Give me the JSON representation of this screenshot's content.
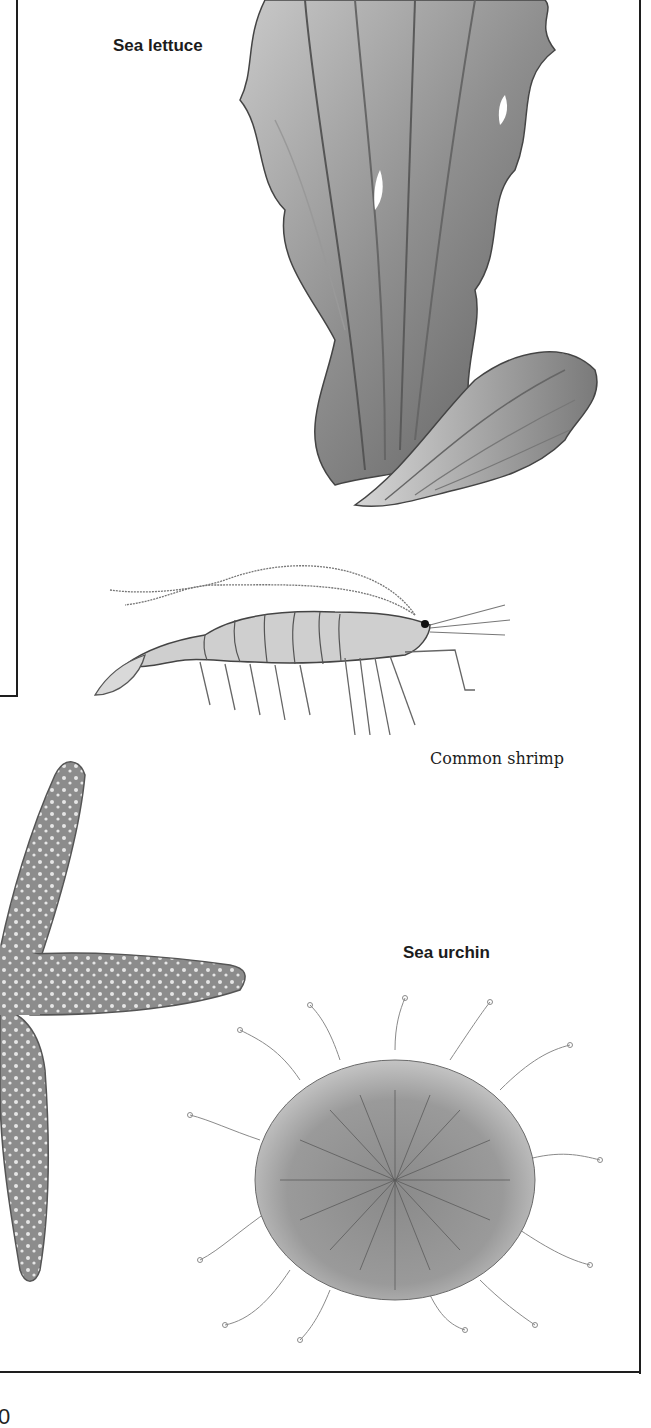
{
  "figure": {
    "labels": {
      "sea_lettuce": "Sea lettuce",
      "common_shrimp": "Common shrimp",
      "sea_urchin": "Sea urchin"
    },
    "illustrations": [
      {
        "name": "sea-lettuce-illustration",
        "subject": "Sea lettuce"
      },
      {
        "name": "common-shrimp-illustration",
        "subject": "Common shrimp"
      },
      {
        "name": "starfish-illustration",
        "subject": "Starfish (partial, cropped)"
      },
      {
        "name": "sea-urchin-illustration",
        "subject": "Sea urchin"
      }
    ],
    "colors": {
      "border": "#1e1e1e",
      "ink": "#1c1c1c",
      "illustration_gray": "#8a8a8a",
      "background": "#ffffff"
    }
  },
  "page": {
    "number_partial": "0"
  }
}
